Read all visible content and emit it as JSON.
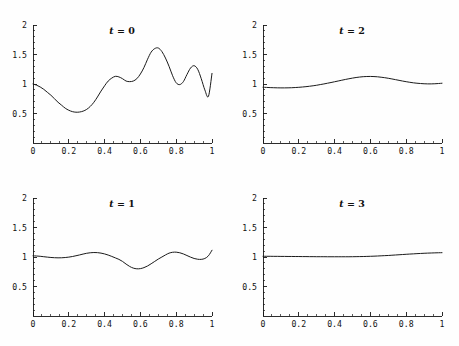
{
  "figure": {
    "layout": "2x2 grid of line plots",
    "background_color": "#fefefe",
    "line_color": "#1a1a1a",
    "axis_color": "#151515"
  },
  "panels": [
    {
      "id": "panel-t0",
      "title": "t = 0",
      "title_var": "t",
      "title_rest": " = 0"
    },
    {
      "id": "panel-t2",
      "title": "t = 2",
      "title_var": "t",
      "title_rest": " = 2"
    },
    {
      "id": "panel-t1",
      "title": "t = 1",
      "title_var": "t",
      "title_rest": " = 1"
    },
    {
      "id": "panel-t3",
      "title": "t = 3",
      "title_var": "t",
      "title_rest": " = 3"
    }
  ],
  "chart_data": [
    {
      "type": "line",
      "title": "t = 0",
      "xlabel": "",
      "ylabel": "",
      "xlim": [
        0,
        1
      ],
      "ylim": [
        0,
        2
      ],
      "xticks": [
        0,
        0.2,
        0.4,
        0.6,
        0.8,
        1
      ],
      "xticklabels": [
        "0",
        "0.2",
        "0.4",
        "0.6",
        "0.8",
        "1"
      ],
      "yticks": [
        0.5,
        1,
        1.5,
        2
      ],
      "yticklabels": [
        "0.5",
        "1",
        "1.5",
        "2"
      ],
      "grid": false,
      "legend": null,
      "x": [
        0,
        0.02,
        0.04,
        0.06,
        0.08,
        0.1,
        0.12,
        0.14,
        0.16,
        0.18,
        0.2,
        0.22,
        0.24,
        0.26,
        0.28,
        0.3,
        0.32,
        0.34,
        0.36,
        0.38,
        0.4,
        0.42,
        0.44,
        0.46,
        0.48,
        0.5,
        0.52,
        0.54,
        0.56,
        0.58,
        0.6,
        0.62,
        0.64,
        0.66,
        0.68,
        0.7,
        0.72,
        0.74,
        0.76,
        0.78,
        0.8,
        0.82,
        0.84,
        0.86,
        0.88,
        0.9,
        0.92,
        0.94,
        0.96,
        0.98,
        1
      ],
      "y": [
        1.0,
        0.98,
        0.95,
        0.91,
        0.86,
        0.81,
        0.75,
        0.69,
        0.64,
        0.59,
        0.555,
        0.532,
        0.522,
        0.525,
        0.54,
        0.57,
        0.62,
        0.69,
        0.78,
        0.88,
        0.97,
        1.05,
        1.1,
        1.13,
        1.12,
        1.09,
        1.05,
        1.04,
        1.05,
        1.09,
        1.17,
        1.28,
        1.42,
        1.54,
        1.6,
        1.61,
        1.55,
        1.44,
        1.3,
        1.14,
        1.02,
        0.99,
        1.04,
        1.16,
        1.27,
        1.31,
        1.25,
        1.09,
        0.9,
        0.79,
        1.18
      ]
    },
    {
      "type": "line",
      "title": "t = 2",
      "xlabel": "",
      "ylabel": "",
      "xlim": [
        0,
        1
      ],
      "ylim": [
        0,
        2
      ],
      "xticks": [
        0,
        0.2,
        0.4,
        0.6,
        0.8,
        1
      ],
      "xticklabels": [
        "0",
        "0.2",
        "0.4",
        "0.6",
        "0.8",
        "1"
      ],
      "yticks": [
        0.5,
        1,
        1.5,
        2
      ],
      "yticklabels": [
        "0.5",
        "1",
        "1.5",
        "2"
      ],
      "grid": false,
      "legend": null,
      "x": [
        0,
        0.02,
        0.04,
        0.06,
        0.08,
        0.1,
        0.12,
        0.14,
        0.16,
        0.18,
        0.2,
        0.22,
        0.24,
        0.26,
        0.28,
        0.3,
        0.32,
        0.34,
        0.36,
        0.38,
        0.4,
        0.42,
        0.44,
        0.46,
        0.48,
        0.5,
        0.52,
        0.54,
        0.56,
        0.58,
        0.6,
        0.62,
        0.64,
        0.66,
        0.68,
        0.7,
        0.72,
        0.74,
        0.76,
        0.78,
        0.8,
        0.82,
        0.84,
        0.86,
        0.88,
        0.9,
        0.92,
        0.94,
        0.96,
        0.98,
        1
      ],
      "y": [
        0.945,
        0.942,
        0.939,
        0.937,
        0.935,
        0.934,
        0.934,
        0.935,
        0.937,
        0.94,
        0.944,
        0.949,
        0.955,
        0.962,
        0.97,
        0.979,
        0.99,
        1.001,
        1.013,
        1.025,
        1.038,
        1.051,
        1.064,
        1.077,
        1.089,
        1.1,
        1.11,
        1.118,
        1.124,
        1.127,
        1.128,
        1.126,
        1.122,
        1.115,
        1.107,
        1.097,
        1.086,
        1.074,
        1.062,
        1.05,
        1.039,
        1.029,
        1.02,
        1.013,
        1.008,
        1.004,
        1.002,
        1.002,
        1.004,
        1.008,
        1.013
      ]
    },
    {
      "type": "line",
      "title": "t = 1",
      "xlabel": "",
      "ylabel": "",
      "xlim": [
        0,
        1
      ],
      "ylim": [
        0,
        2
      ],
      "xticks": [
        0,
        0.2,
        0.4,
        0.6,
        0.8,
        1
      ],
      "xticklabels": [
        "0",
        "0.2",
        "0.4",
        "0.6",
        "0.8",
        "1"
      ],
      "yticks": [
        0.5,
        1,
        1.5,
        2
      ],
      "yticklabels": [
        "0.5",
        "1",
        "1.5",
        "2"
      ],
      "grid": false,
      "legend": null,
      "x": [
        0,
        0.02,
        0.04,
        0.06,
        0.08,
        0.1,
        0.12,
        0.14,
        0.16,
        0.18,
        0.2,
        0.22,
        0.24,
        0.26,
        0.28,
        0.3,
        0.32,
        0.34,
        0.36,
        0.38,
        0.4,
        0.42,
        0.44,
        0.46,
        0.48,
        0.5,
        0.52,
        0.54,
        0.56,
        0.58,
        0.6,
        0.62,
        0.64,
        0.66,
        0.68,
        0.7,
        0.72,
        0.74,
        0.76,
        0.78,
        0.8,
        0.82,
        0.84,
        0.86,
        0.88,
        0.9,
        0.92,
        0.94,
        0.96,
        0.98,
        1
      ],
      "y": [
        1.02,
        1.017,
        1.012,
        1.005,
        0.998,
        0.992,
        0.988,
        0.986,
        0.987,
        0.991,
        0.998,
        1.008,
        1.021,
        1.035,
        1.05,
        1.063,
        1.072,
        1.076,
        1.074,
        1.066,
        1.052,
        1.033,
        1.01,
        0.985,
        0.96,
        0.925,
        0.88,
        0.84,
        0.812,
        0.8,
        0.803,
        0.82,
        0.848,
        0.885,
        0.925,
        0.965,
        1.0,
        1.035,
        1.065,
        1.08,
        1.082,
        1.072,
        1.052,
        1.025,
        0.998,
        0.975,
        0.962,
        0.96,
        0.975,
        1.02,
        1.115
      ]
    },
    {
      "type": "line",
      "title": "t = 3",
      "xlabel": "",
      "ylabel": "",
      "xlim": [
        0,
        1
      ],
      "ylim": [
        0,
        2
      ],
      "xticks": [
        0,
        0.2,
        0.4,
        0.6,
        0.8,
        1
      ],
      "xticklabels": [
        "0",
        "0.2",
        "0.4",
        "0.6",
        "0.8",
        "1"
      ],
      "yticks": [
        0.5,
        1,
        1.5,
        2
      ],
      "yticklabels": [
        "0.5",
        "1",
        "1.5",
        "2"
      ],
      "grid": false,
      "legend": null,
      "x": [
        0,
        0.02,
        0.04,
        0.06,
        0.08,
        0.1,
        0.12,
        0.14,
        0.16,
        0.18,
        0.2,
        0.22,
        0.24,
        0.26,
        0.28,
        0.3,
        0.32,
        0.34,
        0.36,
        0.38,
        0.4,
        0.42,
        0.44,
        0.46,
        0.48,
        0.5,
        0.52,
        0.54,
        0.56,
        0.58,
        0.6,
        0.62,
        0.64,
        0.66,
        0.68,
        0.7,
        0.72,
        0.74,
        0.76,
        0.78,
        0.8,
        0.82,
        0.84,
        0.86,
        0.88,
        0.9,
        0.92,
        0.94,
        0.96,
        0.98,
        1
      ],
      "y": [
        1.012,
        1.012,
        1.012,
        1.011,
        1.011,
        1.01,
        1.01,
        1.009,
        1.009,
        1.008,
        1.008,
        1.007,
        1.007,
        1.006,
        1.006,
        1.005,
        1.005,
        1.005,
        1.004,
        1.004,
        1.004,
        1.004,
        1.004,
        1.004,
        1.004,
        1.005,
        1.006,
        1.007,
        1.008,
        1.01,
        1.012,
        1.014,
        1.017,
        1.02,
        1.023,
        1.026,
        1.03,
        1.034,
        1.038,
        1.042,
        1.046,
        1.05,
        1.053,
        1.057,
        1.06,
        1.063,
        1.066,
        1.068,
        1.07,
        1.072,
        1.073
      ]
    }
  ]
}
